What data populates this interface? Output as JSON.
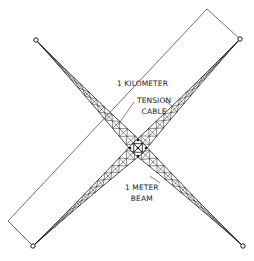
{
  "labels": {
    "length": "1 KILOMETER",
    "cable_line1": "TENSION",
    "cable_line2": "CABLE",
    "beam_line1": "1 METER",
    "beam_line2": "BEAM"
  },
  "colors": {
    "stroke": "#1a1a1a",
    "dimension": "#333333",
    "background": "#ffffff"
  },
  "geometry": {
    "center": [
      138,
      148
    ],
    "nodes": {
      "top_left": [
        36,
        40
      ],
      "top_right": [
        240,
        39
      ],
      "bottom_left": [
        33,
        246
      ],
      "bottom_right": [
        243,
        246
      ]
    }
  }
}
